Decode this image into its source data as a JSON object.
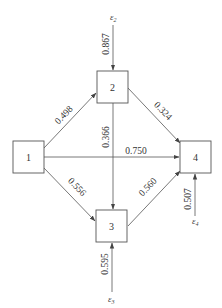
{
  "diagram": {
    "type": "path-diagram",
    "nodes": [
      {
        "id": "1",
        "label": "1"
      },
      {
        "id": "2",
        "label": "2"
      },
      {
        "id": "3",
        "label": "3"
      },
      {
        "id": "4",
        "label": "4"
      }
    ],
    "edges": [
      {
        "from": "1",
        "to": "2",
        "label": "0.498"
      },
      {
        "from": "1",
        "to": "4",
        "label": "0.750"
      },
      {
        "from": "1",
        "to": "3",
        "label": "0.556"
      },
      {
        "from": "2",
        "to": "4",
        "label": "0.324"
      },
      {
        "from": "2",
        "to": "3",
        "label": "0.366"
      },
      {
        "from": "3",
        "to": "4",
        "label": "0.560"
      },
      {
        "from": "e2",
        "to": "2",
        "label": "0.867"
      },
      {
        "from": "e3",
        "to": "3",
        "label": "0.595"
      },
      {
        "from": "e4",
        "to": "4",
        "label": "0.507"
      }
    ],
    "errors": [
      {
        "id": "e2",
        "symbol": "ε",
        "sub": "2"
      },
      {
        "id": "e3",
        "symbol": "ε",
        "sub": "3"
      },
      {
        "id": "e4",
        "symbol": "ε",
        "sub": "4"
      }
    ]
  }
}
